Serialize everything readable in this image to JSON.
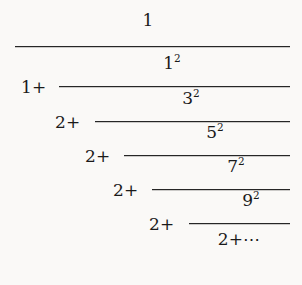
{
  "document": {
    "kind": "mathematical-expression",
    "description": "Brouncker continued fraction",
    "background_color": "#faf9f7",
    "ink_color": "#1a1a1a"
  },
  "expression": {
    "top_numerator": "1",
    "levels": [
      {
        "index": 0,
        "lead_term": "1+",
        "numerator_base": "1",
        "numerator_exponent": "2"
      },
      {
        "index": 1,
        "lead_term": "2+",
        "numerator_base": "3",
        "numerator_exponent": "2"
      },
      {
        "index": 2,
        "lead_term": "2+",
        "numerator_base": "5",
        "numerator_exponent": "2"
      },
      {
        "index": 3,
        "lead_term": "2+",
        "numerator_base": "7",
        "numerator_exponent": "2"
      },
      {
        "index": 4,
        "lead_term": "2+",
        "numerator_base": "9",
        "numerator_exponent": "2"
      }
    ],
    "tail_denominator_term": "2+",
    "tail_ellipsis": "⋯"
  }
}
